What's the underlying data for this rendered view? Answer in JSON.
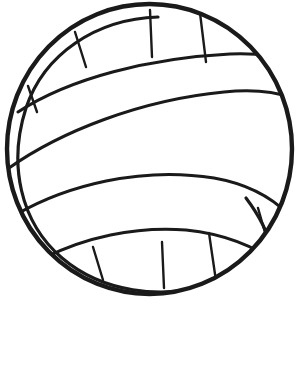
{
  "page": {
    "background_color": "#ffffff",
    "width": 305,
    "height": 385
  },
  "artwork": {
    "name": "volleyball-line-drawing",
    "type": "line-art",
    "stroke_color": "#1a1a1a",
    "fill_color": "#ffffff",
    "has_text": false,
    "ball": {
      "center_x": 149.5,
      "center_y": 149,
      "radius_x": 142.5,
      "radius_y": 145,
      "outer_stroke_width": 4.4,
      "rim_inset": 12,
      "rim_stroke_width": 3.2,
      "seam_stroke_width": 3.0,
      "panel_stroke_width": 2.4
    },
    "bands": [
      {
        "name": "upper-seam",
        "path": "M 18 112 C 70 78, 150 58, 230 54 C 258 53, 278 56, 291 62"
      },
      {
        "name": "mid-seam-upper",
        "path": "M 9 168 C 60 132, 140 100, 224 92 C 254 89, 276 92, 292 98"
      },
      {
        "name": "mid-seam-lower",
        "path": "M 17 214 C 66 186, 140 166, 214 178 C 248 184, 272 198, 288 214"
      },
      {
        "name": "lower-seam",
        "path": "M 44 258 C 84 238, 134 226, 186 230 C 226 234, 258 248, 282 266"
      }
    ],
    "panel_dividers": [
      {
        "name": "panel-divider-top-left-outer",
        "path": "M 28 86 L 37 112"
      },
      {
        "name": "panel-divider-top-left-inner",
        "path": "M 75 32 L 86 67"
      },
      {
        "name": "panel-divider-top-center",
        "path": "M 150 10 L 152 57"
      },
      {
        "name": "panel-divider-top-right-inner",
        "path": "M 200 13 L 206 62"
      },
      {
        "name": "panel-divider-bottom-left-outer",
        "path": "M 93 247 L 103 280"
      },
      {
        "name": "panel-divider-bottom-center",
        "path": "M 162 242 L 164 288"
      },
      {
        "name": "panel-divider-bottom-right-inner",
        "path": "M 209 233 L 216 281"
      },
      {
        "name": "panel-divider-bottom-right-outer",
        "path": "M 258 208 L 268 243"
      }
    ],
    "rim_arcs": [
      {
        "name": "rim-arc-left",
        "path": "M 158 17 C 96 19, 44 54, 26 108 C 8 164, 20 222, 62 258 C 102 292, 160 300, 214 284"
      },
      {
        "name": "rim-arc-right",
        "path": "M 246 198 C 258 214, 268 232, 272 250"
      }
    ]
  }
}
